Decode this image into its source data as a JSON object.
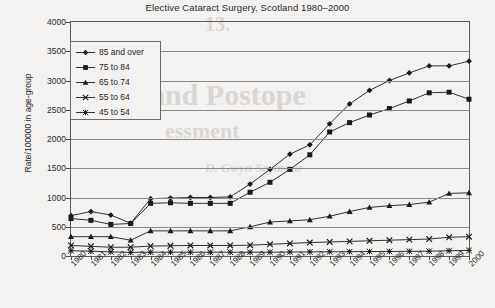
{
  "chart_data": {
    "type": "line",
    "title": "Elective Cataract Surgery, Scotland 1980–2000",
    "xlabel": "",
    "ylabel": "Rate/100000 in age-group",
    "ylim": [
      0,
      4000
    ],
    "ytick_step": 500,
    "yticks": [
      "0",
      "500",
      "1000",
      "1500",
      "2000",
      "2500",
      "3000",
      "3500",
      "4000"
    ],
    "grid": true,
    "legend_position": "upper left",
    "categories": [
      "1980",
      "1981",
      "1982",
      "1983",
      "1984",
      "1985",
      "1986",
      "1987",
      "1988",
      "1989",
      "1990",
      "1991",
      "1992",
      "1993",
      "1994",
      "1995",
      "1996",
      "1997",
      "1998",
      "1999",
      "2000"
    ],
    "series": [
      {
        "name": "85 and over",
        "marker": "diamond",
        "values": [
          690,
          760,
          700,
          560,
          980,
          990,
          1000,
          1000,
          1010,
          1230,
          1480,
          1740,
          1900,
          2260,
          2600,
          2830,
          3000,
          3130,
          3250,
          3250,
          3330
        ]
      },
      {
        "name": "75 to 84",
        "marker": "square",
        "values": [
          640,
          610,
          540,
          555,
          900,
          910,
          900,
          900,
          900,
          1090,
          1260,
          1480,
          1730,
          2120,
          2280,
          2410,
          2520,
          2650,
          2790,
          2800,
          2680
        ]
      },
      {
        "name": "65 to 74",
        "marker": "triangle",
        "values": [
          330,
          330,
          330,
          270,
          430,
          430,
          430,
          430,
          430,
          500,
          580,
          600,
          620,
          680,
          760,
          830,
          860,
          880,
          920,
          1070,
          1080
        ]
      },
      {
        "name": "55 to 64",
        "marker": "cross",
        "values": [
          180,
          165,
          150,
          150,
          170,
          175,
          180,
          180,
          180,
          185,
          200,
          215,
          230,
          240,
          250,
          260,
          270,
          280,
          290,
          320,
          330
        ]
      },
      {
        "name": "45 to 54",
        "marker": "asterisk",
        "values": [
          90,
          82,
          70,
          62,
          65,
          65,
          65,
          65,
          65,
          65,
          65,
          68,
          70,
          72,
          74,
          76,
          78,
          80,
          82,
          90,
          95
        ]
      }
    ]
  },
  "bleed_through": {
    "line1": "and Postope",
    "line2": "essment",
    "line3": "13.",
    "line4": "D. Gwyn Seymour"
  }
}
